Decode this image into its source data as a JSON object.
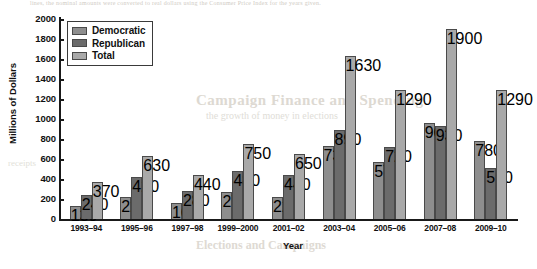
{
  "chart_data": {
    "type": "bar",
    "title": "",
    "xlabel": "Year",
    "ylabel": "Millions of Dollars",
    "ylim": [
      0,
      2000
    ],
    "yticks": [
      0,
      200,
      400,
      600,
      800,
      1000,
      1200,
      1400,
      1600,
      1800,
      2000
    ],
    "grid": false,
    "legend_position": "top-left",
    "categories": [
      "1993–94",
      "1995–96",
      "1997–98",
      "1999–2000",
      "2001–02",
      "2003–04",
      "2005–06",
      "2007–08",
      "2009–10"
    ],
    "series": [
      {
        "name": "Democratic",
        "color": "#8e8e8e",
        "values": [
          130,
          220,
          160,
          270,
          220,
          730,
          570,
          960,
          780
        ]
      },
      {
        "name": "Republican",
        "color": "#6b6b6b",
        "values": [
          240,
          420,
          280,
          480,
          440,
          890,
          720,
          930,
          510
        ]
      },
      {
        "name": "Total",
        "color": "#a9a9a9",
        "values": [
          370,
          630,
          440,
          750,
          650,
          1630,
          1290,
          1900,
          1290
        ]
      }
    ]
  },
  "ghost_text": {
    "top_line": "lines, the nominal amounts were converted to real dollars using the Consumer Price Index for the years given.",
    "mid_line_1": "Campaign Finance and Spending",
    "mid_line_2": "the growth of money in elections",
    "bottom_line": "Elections and Campaigns",
    "left_line": "receipts"
  }
}
